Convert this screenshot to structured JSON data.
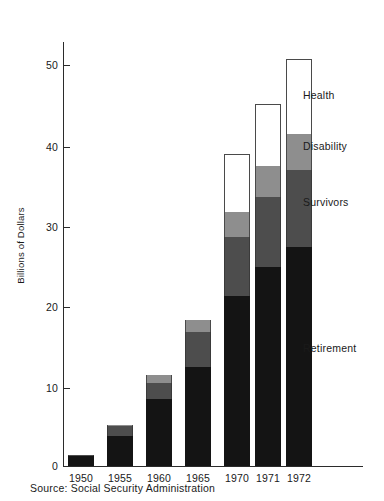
{
  "chart_data": {
    "type": "bar",
    "subtype": "stacked-bar",
    "title": "",
    "xlabel": "",
    "ylabel": "Billions of Dollars",
    "ylim": [
      0,
      55
    ],
    "yticks": [
      10,
      20,
      30,
      40,
      50
    ],
    "ytick_labels": [
      "10",
      "20",
      "30",
      "40",
      "50"
    ],
    "grid": false,
    "legend_position": "right-inline",
    "categories": [
      "1950",
      "1955",
      "1960",
      "1965",
      "1970",
      "1971",
      "1972"
    ],
    "series": [
      {
        "name": "Retirement",
        "color": "#141414",
        "values": [
          1.2,
          3.8,
          8.4,
          12.4,
          21.4,
          25.0,
          27.6
        ]
      },
      {
        "name": "Survivors",
        "color": "#4d4d4d",
        "values": [
          0.2,
          1.2,
          2.0,
          4.4,
          7.4,
          8.8,
          9.6
        ]
      },
      {
        "name": "Disability",
        "color": "#8e8e8e",
        "values": [
          0.0,
          0.2,
          1.0,
          1.6,
          3.1,
          3.9,
          4.6
        ]
      },
      {
        "name": "Health",
        "color": "#ffffff",
        "values": [
          0.0,
          0.0,
          0.0,
          0.0,
          7.4,
          7.8,
          9.4
        ]
      }
    ],
    "totals": [
      1.4,
      5.2,
      11.4,
      18.4,
      39.3,
      45.5,
      51.2
    ],
    "annotations": [
      {
        "label": "Health",
        "value_y": 47.0
      },
      {
        "label": "Disability",
        "value_y": 39.0
      },
      {
        "label": "Survivors",
        "value_y": 32.0
      },
      {
        "label": "Retirement",
        "value_y": 16.5
      }
    ]
  },
  "axis": {
    "y_title": "Billions of Dollars",
    "y_ticks": [
      "50",
      "40",
      "30",
      "20",
      "10"
    ],
    "x_ticks": [
      "1950",
      "1955",
      "1960",
      "1965",
      "1970",
      "1971",
      "1972"
    ]
  },
  "legend": {
    "items": [
      {
        "label": "Health"
      },
      {
        "label": "Disability"
      },
      {
        "label": "Survivors"
      },
      {
        "label": "Retirement"
      }
    ]
  },
  "footer": {
    "source": "Source:  Social Security Administration"
  },
  "colors": {
    "retirement": "#141414",
    "survivors": "#4d4d4d",
    "disability": "#8e8e8e",
    "health": "#ffffff",
    "axis": "#2b2b2b",
    "text": "#1a1a1a"
  }
}
